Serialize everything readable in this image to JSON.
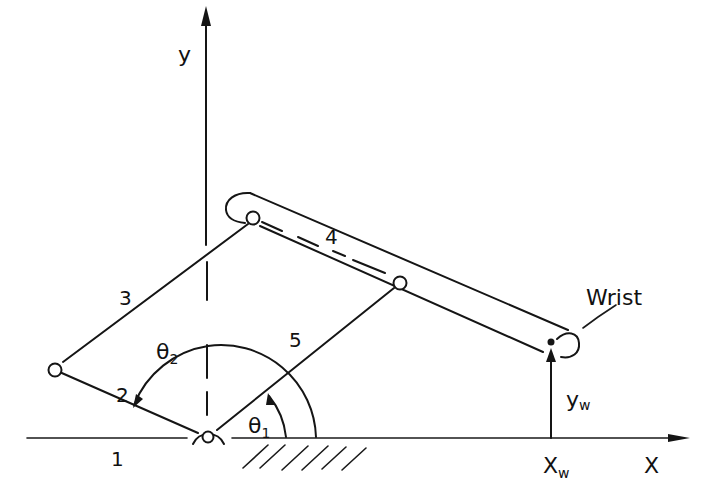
{
  "diagram": {
    "type": "five-bar linkage manipulator (kinematic sketch)",
    "axes": {
      "x_label": "X",
      "y_label": "y"
    },
    "links": [
      {
        "id": "1",
        "label": "1",
        "description": "ground link"
      },
      {
        "id": "2",
        "label": "2",
        "description": "input crank at angle θ2"
      },
      {
        "id": "3",
        "label": "3",
        "description": "coupler"
      },
      {
        "id": "4",
        "label": "4",
        "description": "extended bar carrying wrist"
      },
      {
        "id": "5",
        "label": "5",
        "description": "input crank at angle θ1"
      }
    ],
    "angles": [
      {
        "symbol": "θ",
        "subscript": "2",
        "label": "θ2"
      },
      {
        "symbol": "θ",
        "subscript": "1",
        "label": "θ1"
      }
    ],
    "wrist": {
      "label": "Wrist",
      "x_coord_label": "X",
      "x_coord_sub": "w",
      "y_coord_label": "y",
      "y_coord_sub": "w"
    },
    "colors": {
      "ink": "#151515",
      "background": "#ffffff"
    }
  }
}
